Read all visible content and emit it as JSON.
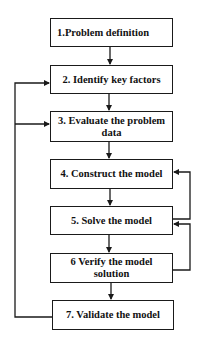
{
  "diagram": {
    "type": "flowchart",
    "nodes": [
      {
        "id": "n1",
        "label": "1.Problem definition"
      },
      {
        "id": "n2",
        "label": "2. Identify key factors"
      },
      {
        "id": "n3",
        "label": "3. Evaluate the problem data"
      },
      {
        "id": "n4",
        "label": "4. Construct the model"
      },
      {
        "id": "n5",
        "label": "5. Solve the model"
      },
      {
        "id": "n6",
        "label": "6  Verify the model solution"
      },
      {
        "id": "n7",
        "label": "7. Validate the model"
      }
    ],
    "edges": [
      {
        "from": "n1",
        "to": "n2"
      },
      {
        "from": "n2",
        "to": "n3"
      },
      {
        "from": "n3",
        "to": "n4"
      },
      {
        "from": "n4",
        "to": "n5"
      },
      {
        "from": "n5",
        "to": "n6"
      },
      {
        "from": "n6",
        "to": "n7"
      },
      {
        "from": "n5",
        "to": "n4",
        "kind": "feedback-right"
      },
      {
        "from": "n6",
        "to": "n5",
        "kind": "feedback-right"
      },
      {
        "from": "n7",
        "to": "n2",
        "kind": "feedback-left"
      },
      {
        "from": "n7",
        "to": "n3",
        "kind": "feedback-left"
      }
    ],
    "colors": {
      "line": "#1a1a1a",
      "box_fill": "#ffffff",
      "text": "#111111"
    }
  }
}
